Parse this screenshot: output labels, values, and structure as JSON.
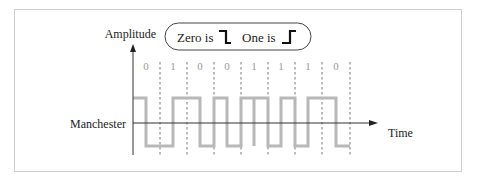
{
  "diagram": {
    "y_axis_label": "Amplitude",
    "x_axis_label": "Time",
    "signal_label": "Manchester",
    "legend": {
      "zero_label": "Zero is",
      "zero_symbol": "high-to-low-transition",
      "one_label": "One is",
      "one_symbol": "low-to-high-transition"
    },
    "bits": [
      "0",
      "1",
      "0",
      "0",
      "1",
      "1",
      "1",
      "0"
    ],
    "colors": {
      "waveform": "#b8b8b8",
      "axes": "#333333",
      "bit_labels": "#9a9a9a",
      "frame": "#cfcfcf"
    }
  }
}
